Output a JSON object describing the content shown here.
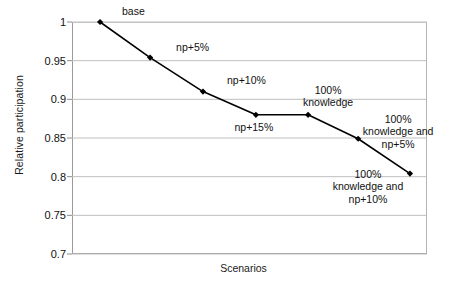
{
  "chart_data": {
    "type": "line",
    "title": "",
    "xlabel": "Scenarios",
    "ylabel": "Relative participation",
    "ylim": [
      0.7,
      1.0
    ],
    "yticks": [
      "1",
      "0.95",
      "0.9",
      "0.85",
      "0.8",
      "0.75",
      "0.7"
    ],
    "ytick_values": [
      1,
      0.95,
      0.9,
      0.85,
      0.8,
      0.75,
      0.7
    ],
    "grid": "horizontal",
    "legend": "none",
    "categories": [
      "base",
      "np+5%",
      "np+10%",
      "np+15%",
      "100%\nknowledge",
      "100%\nknowledge and\nnp+5%",
      "100%\nknowledge and\nnp+10%"
    ],
    "values": [
      1.0,
      0.954,
      0.91,
      0.88,
      0.88,
      0.849,
      0.804
    ],
    "series": [
      {
        "name": "Relative participation",
        "values": [
          1.0,
          0.954,
          0.91,
          0.88,
          0.88,
          0.849,
          0.804
        ]
      }
    ],
    "colors": {
      "line": "#000000",
      "marker": "#000000",
      "grid": "#bfbfbf",
      "axis": "#8c8c8c",
      "text": "#111111",
      "background": "#ffffff"
    }
  },
  "annotations": [
    {
      "text": "base",
      "align": "center"
    },
    {
      "text": "np+5%",
      "align": "center"
    },
    {
      "text": "np+10%",
      "align": "center"
    },
    {
      "text": "np+15%",
      "align": "center"
    },
    {
      "text": "100%\nknowledge",
      "align": "center"
    },
    {
      "text": "100%\nknowledge and\nnp+5%",
      "align": "center"
    },
    {
      "text": "100%\nknowledge and\nnp+10%",
      "align": "center"
    }
  ]
}
